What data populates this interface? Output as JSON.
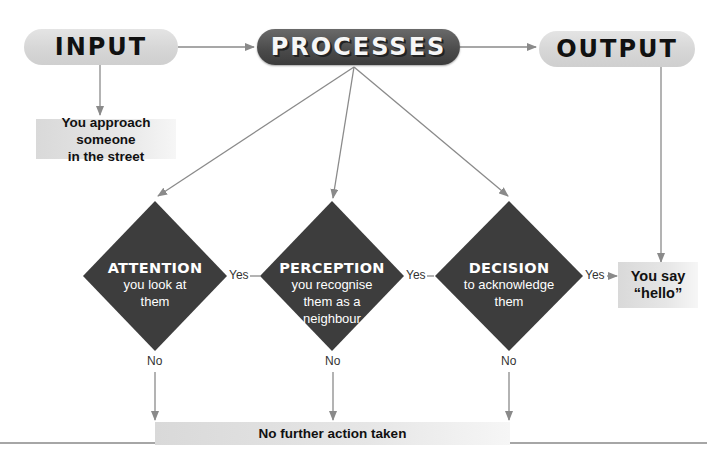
{
  "header": {
    "input_label": "INPUT",
    "processes_label": "PROCESSES",
    "output_label": "OUTPUT"
  },
  "input_box": {
    "line1": "You approach someone",
    "line2": "in the street"
  },
  "decisions": [
    {
      "title": "ATTENTION",
      "line1": "you look at",
      "line2": "them",
      "line3": ""
    },
    {
      "title": "PERCEPTION",
      "line1": "you recognise",
      "line2": "them as a",
      "line3": "neighbour"
    },
    {
      "title": "DECISION",
      "line1": "to acknowledge",
      "line2": "them",
      "line3": ""
    }
  ],
  "labels": {
    "yes": "Yes",
    "no": "No"
  },
  "output_box": {
    "line1": "You say",
    "line2": "“hello”"
  },
  "no_action_box": {
    "text": "No further action taken"
  },
  "colors": {
    "diamond": "#3d3d3d",
    "light_pill": "#d9d9d9",
    "dark_pill": "#4a4a4a",
    "arrow": "#8a8a8a",
    "box": "#e3e3e3"
  }
}
